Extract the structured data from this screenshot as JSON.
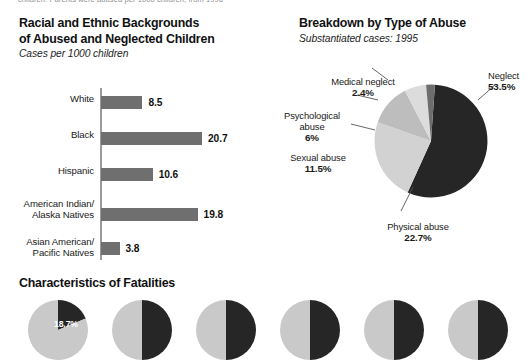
{
  "top_caption": "children. Parents were abused per 1000 children, from 1996",
  "bar_chart": {
    "title_line1": "Racial and Ethnic Backgrounds",
    "title_line2": "of Abused and Neglected Children",
    "subtitle": "Cases per 1000 children",
    "bar_color": "#6f6f6f",
    "axis_color": "#9a9a9a"
  },
  "pie_chart": {
    "title": "Breakdown by Type of Abuse",
    "subtitle": "Substantiated cases: 1995"
  },
  "fatalities": {
    "title": "Characteristics of Fatalities",
    "mini_first_value": "18.7%"
  },
  "chart_data": [
    {
      "type": "bar",
      "title": "Racial and Ethnic Backgrounds of Abused and Neglected Children",
      "subtitle": "Cases per 1000 children",
      "xlabel": "",
      "ylabel": "",
      "orientation": "horizontal",
      "grid": false,
      "legend": "none",
      "xlim": [
        0,
        22
      ],
      "categories": [
        "White",
        "Black",
        "Hispanic",
        "American Indian/\nAlaska Natives",
        "Asian American/\nPacific Natives"
      ],
      "category_lines": [
        [
          "White"
        ],
        [
          "Black"
        ],
        [
          "Hispanic"
        ],
        [
          "American Indian/",
          "Alaska Natives"
        ],
        [
          "Asian American/",
          "Pacific Natives"
        ]
      ],
      "values": [
        8.5,
        20.7,
        10.6,
        19.8,
        3.8
      ],
      "value_labels": [
        "8.5",
        "20.7",
        "10.6",
        "19.8",
        "3.8"
      ]
    },
    {
      "type": "pie",
      "title": "Breakdown by Type of Abuse",
      "subtitle": "Substantiated cases: 1995",
      "legend": "callout-labels",
      "labels": [
        "Neglect",
        "Physical abuse",
        "Sexual abuse",
        "Psychological abuse",
        "Medical neglect"
      ],
      "values": [
        53.5,
        22.7,
        11.5,
        6.0,
        2.4
      ],
      "value_labels": [
        "53.5%",
        "22.7%",
        "11.5%",
        "6%",
        "2.4%"
      ],
      "colors": [
        "#262626",
        "#d2d2d2",
        "#bdbdbd",
        "#dcdcdc",
        "#6d6d6d"
      ],
      "label_lines": [
        [
          "Neglect"
        ],
        [
          "Physical abuse"
        ],
        [
          "Sexual abuse"
        ],
        [
          "Psychological",
          "abuse"
        ],
        [
          "Medical neglect"
        ]
      ]
    },
    {
      "type": "pie",
      "title": "Characteristics of Fatalities",
      "note": "row of six small two-segment pies, cropped at bottom edge",
      "count": 6,
      "series": [
        {
          "name": "pie-1",
          "values": [
            18.7,
            81.3
          ],
          "value_labels": [
            "18.7%",
            ""
          ]
        },
        {
          "name": "pie-2",
          "values": [
            50,
            50
          ],
          "value_labels": [
            "",
            ""
          ]
        },
        {
          "name": "pie-3",
          "values": [
            50,
            50
          ],
          "value_labels": [
            "",
            ""
          ]
        },
        {
          "name": "pie-4",
          "values": [
            50,
            50
          ],
          "value_labels": [
            "",
            ""
          ]
        },
        {
          "name": "pie-5",
          "values": [
            50,
            50
          ],
          "value_labels": [
            "",
            ""
          ]
        },
        {
          "name": "pie-6",
          "values": [
            50,
            50
          ],
          "value_labels": [
            "",
            ""
          ]
        }
      ],
      "colors": [
        "#262626",
        "#c9c9c9"
      ]
    }
  ]
}
